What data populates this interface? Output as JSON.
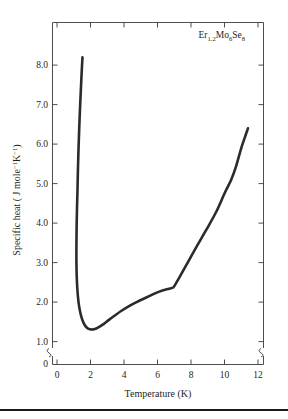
{
  "figure": {
    "annotation": {
      "element": "Er",
      "sub1": "1.2",
      "compound1": "Mo",
      "sub2": "6",
      "compound2": "Se",
      "sub3": "8",
      "full": "Er1.2Mo6Se8"
    }
  },
  "chart_data": {
    "type": "line",
    "title": "",
    "annotation": "Er1.2Mo6Se8",
    "xlabel": "Temperature (K)",
    "ylabel": "Specific heat ( J mole-1K-1)",
    "ylabel_parts": {
      "lead": "Specific heat ( J mole",
      "sup1": "−1",
      "mid": "K",
      "sup2": "−1",
      "tail": ")"
    },
    "xlim": [
      0,
      12.6
    ],
    "ylim": [
      0.88,
      8.62
    ],
    "xticks": [
      0,
      2,
      4,
      6,
      8,
      10,
      12
    ],
    "xticklabels": [
      "0",
      "2",
      "4",
      "6",
      "8",
      "10",
      "12"
    ],
    "yticks": [
      1.0,
      2.0,
      3.0,
      4.0,
      5.0,
      6.0,
      7.0,
      8.0
    ],
    "yticklabels": [
      "1.0",
      "2.0",
      "3.0",
      "4.0",
      "5.0",
      "6.0",
      "7.0",
      "8.0"
    ],
    "y_origin_label": "0",
    "axis_break": true,
    "axis_break_note": "break on both vertical axes between 0 and 1.0",
    "grid": false,
    "legend": false,
    "series": [
      {
        "name": "specific heat",
        "color": "#2b2b2b",
        "x": [
          1.52,
          1.46,
          1.4,
          1.34,
          1.29,
          1.25,
          1.22,
          1.19,
          1.17,
          1.16,
          1.16,
          1.18,
          1.22,
          1.28,
          1.36,
          1.46,
          1.58,
          1.72,
          1.86,
          2.0,
          2.16,
          2.34,
          2.55,
          2.8,
          3.1,
          3.45,
          3.85,
          4.3,
          4.75,
          5.2,
          5.6,
          5.95,
          6.25,
          6.5,
          6.7,
          6.88,
          7.0,
          7.3,
          7.75,
          8.3,
          8.9,
          9.5,
          10.0,
          10.4,
          10.7,
          11.0,
          11.2,
          11.4
        ],
        "y": [
          8.2,
          7.7,
          7.15,
          6.55,
          5.95,
          5.35,
          4.8,
          4.3,
          3.85,
          3.4,
          3.0,
          2.62,
          2.3,
          2.02,
          1.8,
          1.62,
          1.48,
          1.38,
          1.33,
          1.31,
          1.31,
          1.33,
          1.38,
          1.45,
          1.55,
          1.66,
          1.78,
          1.9,
          2.0,
          2.09,
          2.17,
          2.24,
          2.29,
          2.32,
          2.34,
          2.36,
          2.4,
          2.62,
          2.96,
          3.38,
          3.82,
          4.28,
          4.75,
          5.1,
          5.45,
          5.9,
          6.15,
          6.4
        ]
      }
    ],
    "features": [
      {
        "name": "low-temperature upturn",
        "t": 1.52,
        "c": 8.2
      },
      {
        "name": "minimum",
        "t": 2.05,
        "c": 1.31
      },
      {
        "name": "plateau-kink",
        "t": 6.9,
        "c": 2.36
      },
      {
        "name": "slope-change",
        "t": 10.4,
        "c": 5.1
      },
      {
        "name": "endpoint",
        "t": 11.4,
        "c": 6.4
      }
    ]
  }
}
